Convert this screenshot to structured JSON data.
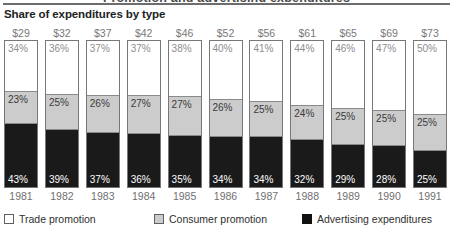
{
  "cut_headline": "Promotion and advertising expenditures",
  "chart_title": "Share of expenditures by type",
  "legend": {
    "position": "bottom",
    "items": [
      {
        "label": "Trade promotion",
        "swatch": "white",
        "color": "#ffffff"
      },
      {
        "label": "Consumer promotion",
        "swatch": "gray",
        "color": "#cccccc"
      },
      {
        "label": "Advertising expenditures",
        "swatch": "black",
        "color": "#111111"
      }
    ]
  },
  "chart_data": {
    "type": "bar",
    "title": "Share of expenditures by type",
    "subtype": "100% stacked vertical bars",
    "xlabel": "",
    "ylabel": "",
    "ylim": [
      0,
      100
    ],
    "grid": false,
    "legend_position": "bottom",
    "categories": [
      "1981",
      "1982",
      "1983",
      "1984",
      "1985",
      "1986",
      "1987",
      "1988",
      "1989",
      "1990",
      "1991"
    ],
    "totals_label": "Total expenditures ($ billions)",
    "totals": [
      "$29",
      "$32",
      "$37",
      "$42",
      "$46",
      "$52",
      "$56",
      "$61",
      "$65",
      "$69",
      "$73"
    ],
    "totals_values": [
      29,
      32,
      37,
      42,
      46,
      52,
      56,
      61,
      65,
      69,
      73
    ],
    "series": [
      {
        "name": "Trade promotion",
        "color": "#ffffff",
        "values": [
          34,
          36,
          37,
          37,
          38,
          40,
          41,
          44,
          46,
          47,
          50
        ],
        "labels": [
          "34%",
          "36%",
          "37%",
          "37%",
          "38%",
          "40%",
          "41%",
          "44%",
          "46%",
          "47%",
          "50%"
        ]
      },
      {
        "name": "Consumer promotion",
        "color": "#cccccc",
        "values": [
          23,
          25,
          26,
          27,
          27,
          26,
          25,
          24,
          25,
          25,
          25
        ],
        "labels": [
          "23%",
          "25%",
          "26%",
          "27%",
          "27%",
          "26%",
          "25%",
          "24%",
          "25%",
          "25%",
          "25%"
        ]
      },
      {
        "name": "Advertising expenditures",
        "color": "#1a1a1a",
        "values": [
          43,
          39,
          37,
          36,
          35,
          34,
          34,
          32,
          29,
          28,
          25
        ],
        "labels": [
          "43%",
          "39%",
          "37%",
          "36%",
          "35%",
          "34%",
          "34%",
          "32%",
          "29%",
          "28%",
          "25%"
        ]
      }
    ]
  }
}
